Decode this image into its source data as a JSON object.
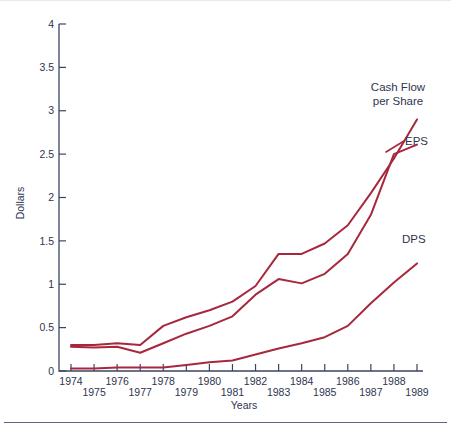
{
  "chart_data": {
    "type": "line",
    "title": "",
    "xlabel": "Years",
    "ylabel": "Dollars",
    "xlim": [
      1974,
      1989
    ],
    "ylim": [
      0,
      4
    ],
    "ytick_labels": [
      "0",
      "0.5",
      "1",
      "1.5",
      "2",
      "2.5",
      "3",
      "3.5",
      "4"
    ],
    "ytick_values": [
      0,
      0.5,
      1,
      1.5,
      2,
      2.5,
      3,
      3.5,
      4
    ],
    "grid": false,
    "legend_position": "inline-right-annotations",
    "categories": [
      "1974",
      "1975",
      "1976",
      "1977",
      "1978",
      "1979",
      "1980",
      "1981",
      "1982",
      "1983",
      "1984",
      "1985",
      "1986",
      "1987",
      "1988",
      "1989"
    ],
    "series": [
      {
        "name": "Cash Flow per Share",
        "label_lines": [
          "Cash Flow",
          "per Share"
        ],
        "color": "#A8273C",
        "values": [
          0.3,
          0.3,
          0.32,
          0.3,
          0.52,
          0.62,
          0.7,
          0.8,
          0.98,
          1.35,
          1.35,
          1.47,
          1.68,
          2.05,
          2.45,
          2.9
        ]
      },
      {
        "name": "EPS",
        "label_lines": [
          "EPS"
        ],
        "color": "#A8273C",
        "values": [
          0.28,
          0.27,
          0.28,
          0.21,
          0.32,
          0.43,
          0.52,
          0.63,
          0.88,
          1.06,
          1.01,
          1.12,
          1.35,
          1.8,
          2.5,
          2.61
        ]
      },
      {
        "name": "DPS",
        "label_lines": [
          "DPS"
        ],
        "color": "#A8273C",
        "values": [
          0.03,
          0.03,
          0.04,
          0.04,
          0.04,
          0.07,
          0.1,
          0.12,
          0.19,
          0.26,
          0.32,
          0.39,
          0.52,
          0.78,
          1.02,
          1.24
        ]
      }
    ]
  },
  "axes": {
    "y_title": "Dollars",
    "x_title": "Years"
  },
  "annotations": {
    "cash_flow_line1": "Cash Flow",
    "cash_flow_line2": "per Share",
    "eps": "EPS",
    "dps": "DPS"
  },
  "colors": {
    "series_red": "#A8273C",
    "axis_ink": "#3b4464",
    "text_ink": "#2e3550",
    "background": "#ffffff",
    "rule": "#5a6484"
  }
}
